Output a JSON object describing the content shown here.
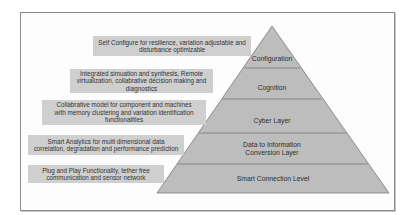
{
  "diagram": {
    "type": "pyramid",
    "layers": [
      {
        "name": "Configuration",
        "lines": [
          "Configuration"
        ]
      },
      {
        "name": "Cognition",
        "lines": [
          "Cognition"
        ]
      },
      {
        "name": "Cyber Layer",
        "lines": [
          "Cyber Layer"
        ]
      },
      {
        "name": "Data to Information Conversion Layer",
        "lines": [
          "Data to Information",
          "Conversion Layer"
        ]
      },
      {
        "name": "Smart Connection Level",
        "lines": [
          "Smart Connection Level"
        ]
      }
    ],
    "descriptions": [
      {
        "lines": [
          "Self Configure for resilience, variation adjustable and",
          "disturbance optimizable"
        ]
      },
      {
        "lines": [
          "Integrated simuation and synthesis, Remote",
          "virtualization, collabrative decision making and",
          "diagnostics"
        ]
      },
      {
        "lines": [
          "Collabrative model for component and machines",
          "with memory clustering and variation identification",
          "functionalities"
        ]
      },
      {
        "lines": [
          "Smart Analytics for multi dimensional data",
          "correlation, degradation and performance prediction"
        ]
      },
      {
        "lines": [
          "Plug and Play Functionality, tether free",
          "communication and sensor network"
        ]
      }
    ],
    "colors": {
      "pyramid_fill": "#bdbdbd",
      "pyramid_stroke": "#6e6e6e",
      "label_box_fill": "#cfcfcf",
      "text": "#333333",
      "frame_border": "#8a8a8a"
    }
  }
}
